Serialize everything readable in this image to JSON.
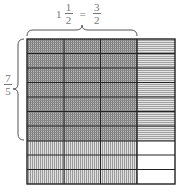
{
  "diagram": {
    "top_label": {
      "whole": "1",
      "mixed_num": "1",
      "mixed_den": "2",
      "equals": "=",
      "improper_num": "3",
      "improper_den": "2"
    },
    "side_label": {
      "num": "7",
      "den": "5"
    },
    "grid": {
      "columns": 4,
      "rows": 10,
      "shaded_columns": 3,
      "shaded_rows": 7,
      "description": "Unit square divided into 2 columns-per-whole and 5 rows-per-whole; 3 columns × 7 rows region represents 3/2 × 7/5"
    },
    "colors": {
      "grid_line": "#222222",
      "overlap_fill": "#9a9a9a",
      "vertical_hatch": "#bbbbbb",
      "horizontal_hatch": "#c4c4c4",
      "empty": "#ffffff",
      "label": "#777777"
    }
  }
}
